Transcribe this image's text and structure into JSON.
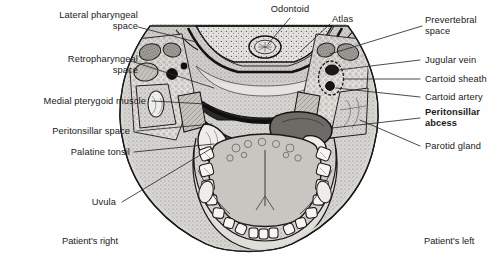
{
  "figure": {
    "modality": "line-drawing anatomical cross-section",
    "view": "axial / transverse section at the level of C1 (atlas)",
    "colors": {
      "background": "#ffffff",
      "ink": "#1a1a1a",
      "leader_line": "#2b2b2b",
      "soft_tissue_light": "#d8d6d2",
      "soft_tissue_mid": "#b3b0ab",
      "soft_tissue_dark": "#8e8b86",
      "abscess_fill": "#6e6b67",
      "tooth_fill": "#f4f3f0",
      "air_space": "#2a2a2a",
      "bone_fill": "#eceae6",
      "tongue_fill": "#c9c6c1"
    }
  },
  "labels": {
    "left": [
      {
        "id": "lateral-pharyngeal-space",
        "text": "Lateral pharyngeal\nspace",
        "bold": false
      },
      {
        "id": "retropharyngeal-space",
        "text": "Retropharyngeal\nspace",
        "bold": false
      },
      {
        "id": "medial-pterygoid-muscle",
        "text": "Medial pterygoid muscle",
        "bold": false
      },
      {
        "id": "peritonsillar-space",
        "text": "Peritonsillar space",
        "bold": false
      },
      {
        "id": "palatine-tonsil",
        "text": "Palatine tonsil",
        "bold": false
      },
      {
        "id": "uvula",
        "text": "Uvula",
        "bold": false
      }
    ],
    "top": [
      {
        "id": "odontoid",
        "text": "Odontoid",
        "bold": false
      },
      {
        "id": "atlas",
        "text": "Atlas",
        "bold": false
      }
    ],
    "right": [
      {
        "id": "prevertebral-space",
        "text": "Prevertebral\nspace",
        "bold": false
      },
      {
        "id": "jugular-vein",
        "text": "Jugular vein",
        "bold": false
      },
      {
        "id": "cartoid-sheath",
        "text": "Cartoid sheath",
        "bold": false
      },
      {
        "id": "cartoid-artery",
        "text": "Cartoid artery",
        "bold": false
      },
      {
        "id": "peritonsillar-abcess",
        "text": "Peritonsillar\nabcess",
        "bold": true
      },
      {
        "id": "parotid-gland",
        "text": "Parotid gland",
        "bold": false
      }
    ],
    "orientation": [
      {
        "id": "patients-right",
        "text": "Patient's right"
      },
      {
        "id": "patients-left",
        "text": "Patient's left"
      }
    ]
  }
}
